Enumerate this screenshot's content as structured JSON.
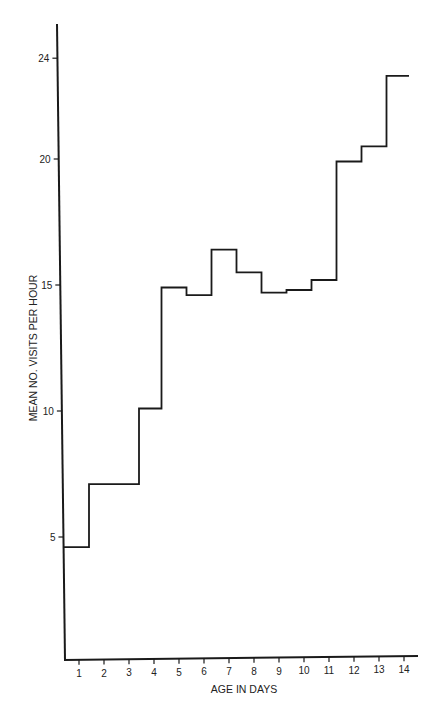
{
  "chart_data": {
    "type": "line",
    "style": "step",
    "title": "",
    "xlabel": "AGE IN DAYS",
    "ylabel": "MEAN NO. VISITS PER HOUR",
    "x_ticks": [
      1,
      2,
      3,
      4,
      5,
      6,
      7,
      8,
      9,
      10,
      11,
      12,
      13,
      14
    ],
    "y_ticks": [
      5,
      10,
      15,
      20,
      24
    ],
    "xlim": [
      0,
      14.5
    ],
    "ylim": [
      0,
      25.5
    ],
    "grid": false,
    "legend": null,
    "steps": [
      {
        "x_start": 0.0,
        "x_end": 1.4,
        "y": 4.6
      },
      {
        "x_start": 1.4,
        "x_end": 3.4,
        "y": 7.1
      },
      {
        "x_start": 3.4,
        "x_end": 4.3,
        "y": 10.1
      },
      {
        "x_start": 4.3,
        "x_end": 5.3,
        "y": 14.9
      },
      {
        "x_start": 5.3,
        "x_end": 6.3,
        "y": 14.6
      },
      {
        "x_start": 6.3,
        "x_end": 7.3,
        "y": 16.4
      },
      {
        "x_start": 7.3,
        "x_end": 8.3,
        "y": 15.5
      },
      {
        "x_start": 8.3,
        "x_end": 9.3,
        "y": 14.7
      },
      {
        "x_start": 9.3,
        "x_end": 10.3,
        "y": 14.8
      },
      {
        "x_start": 10.3,
        "x_end": 11.3,
        "y": 15.2
      },
      {
        "x_start": 11.3,
        "x_end": 12.3,
        "y": 19.9
      },
      {
        "x_start": 12.3,
        "x_end": 13.3,
        "y": 20.5
      },
      {
        "x_start": 13.3,
        "x_end": 14.2,
        "y": 23.3
      }
    ],
    "series": [
      {
        "name": "Mean visits per hour",
        "x": [
          1,
          2,
          3,
          4,
          5,
          6,
          7,
          8,
          9,
          10,
          11,
          12,
          13,
          14
        ],
        "values": [
          4.6,
          7.1,
          7.1,
          10.1,
          14.9,
          14.6,
          16.4,
          15.5,
          14.7,
          14.8,
          15.2,
          19.9,
          20.5,
          23.3
        ]
      }
    ]
  }
}
